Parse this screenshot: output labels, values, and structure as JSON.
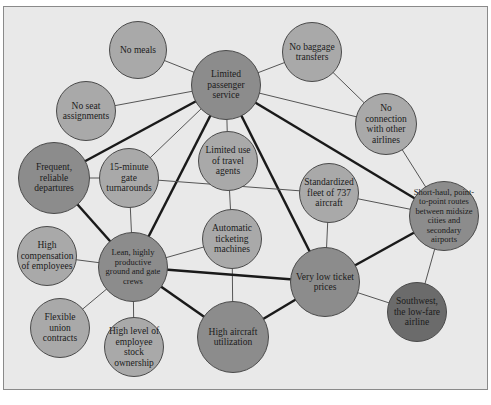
{
  "diagram": {
    "colors": {
      "background": "#e9e9e9",
      "light_node": "#a9a9a9",
      "hub_node": "#8c8c8c",
      "core_node": "#6b6b6b",
      "line": "#1a1a1a"
    },
    "nodes": [
      {
        "id": "lps",
        "label": "Limited passenger service",
        "x": 226,
        "y": 85,
        "r": 35,
        "tone": "mid"
      },
      {
        "id": "nm",
        "label": "No meals",
        "x": 138,
        "y": 50,
        "r": 29,
        "tone": "light"
      },
      {
        "id": "nsa",
        "label": "No seat assignments",
        "x": 86,
        "y": 111,
        "r": 30,
        "tone": "light"
      },
      {
        "id": "nbt",
        "label": "No baggage transfers",
        "x": 312,
        "y": 52,
        "r": 30,
        "tone": "light"
      },
      {
        "id": "nc",
        "label": "No connection with other airlines",
        "x": 386,
        "y": 124,
        "r": 31,
        "tone": "light"
      },
      {
        "id": "frd",
        "label": "Frequent, reliable departures",
        "x": 54,
        "y": 178,
        "r": 36,
        "tone": "mid"
      },
      {
        "id": "gt",
        "label": "15-minute gate turnarounds",
        "x": 129,
        "y": 178,
        "r": 30,
        "tone": "light"
      },
      {
        "id": "lta",
        "label": "Limited use of travel agents",
        "x": 228,
        "y": 161,
        "r": 30,
        "tone": "light"
      },
      {
        "id": "sf",
        "label": "Standardized fleet of 737 aircraft",
        "x": 329,
        "y": 193,
        "r": 30,
        "tone": "light"
      },
      {
        "id": "sh",
        "label": "Short-haul, point-to-point routes between midsize cities and secondary airports",
        "x": 444,
        "y": 216,
        "r": 35,
        "tone": "mid"
      },
      {
        "id": "atm",
        "label": "Automatic ticketing machines",
        "x": 232,
        "y": 239,
        "r": 30,
        "tone": "light"
      },
      {
        "id": "hc",
        "label": "High compensation of employees",
        "x": 47,
        "y": 256,
        "r": 30,
        "tone": "light"
      },
      {
        "id": "lean",
        "label": "Lean, highly productive ground and gate crews",
        "x": 133,
        "y": 267,
        "r": 35,
        "tone": "mid"
      },
      {
        "id": "vlt",
        "label": "Very low ticket prices",
        "x": 325,
        "y": 282,
        "r": 35,
        "tone": "mid"
      },
      {
        "id": "sw",
        "label": "Southwest, the low-fare airline",
        "x": 417,
        "y": 312,
        "r": 30,
        "tone": "dark"
      },
      {
        "id": "fuc",
        "label": "Flexible union contracts",
        "x": 60,
        "y": 328,
        "r": 30,
        "tone": "light"
      },
      {
        "id": "hes",
        "label": "High level of employee stock ownership",
        "x": 134,
        "y": 347,
        "r": 30,
        "tone": "light"
      },
      {
        "id": "hau",
        "label": "High aircraft utilization",
        "x": 233,
        "y": 337,
        "r": 36,
        "tone": "mid"
      }
    ],
    "edges": [
      {
        "from": "lps",
        "to": "nm",
        "w": 1
      },
      {
        "from": "lps",
        "to": "nsa",
        "w": 1
      },
      {
        "from": "lps",
        "to": "nbt",
        "w": 1
      },
      {
        "from": "lps",
        "to": "nc",
        "w": 1
      },
      {
        "from": "lps",
        "to": "frd",
        "w": 2.5
      },
      {
        "from": "lps",
        "to": "gt",
        "w": 1
      },
      {
        "from": "lps",
        "to": "lta",
        "w": 1
      },
      {
        "from": "lps",
        "to": "lean",
        "w": 2.5
      },
      {
        "from": "lps",
        "to": "vlt",
        "w": 2.5
      },
      {
        "from": "lps",
        "to": "sh",
        "w": 2.5
      },
      {
        "from": "nbt",
        "to": "nc",
        "w": 1
      },
      {
        "from": "nc",
        "to": "sh",
        "w": 1
      },
      {
        "from": "frd",
        "to": "gt",
        "w": 1
      },
      {
        "from": "frd",
        "to": "lean",
        "w": 2.5
      },
      {
        "from": "gt",
        "to": "lean",
        "w": 1
      },
      {
        "from": "gt",
        "to": "sf",
        "w": 1
      },
      {
        "from": "lta",
        "to": "atm",
        "w": 1
      },
      {
        "from": "sf",
        "to": "sh",
        "w": 1
      },
      {
        "from": "sf",
        "to": "vlt",
        "w": 1
      },
      {
        "from": "sh",
        "to": "vlt",
        "w": 2.5
      },
      {
        "from": "sh",
        "to": "sw",
        "w": 1
      },
      {
        "from": "atm",
        "to": "lean",
        "w": 1
      },
      {
        "from": "atm",
        "to": "hau",
        "w": 1
      },
      {
        "from": "lean",
        "to": "vlt",
        "w": 2.5
      },
      {
        "from": "lean",
        "to": "hc",
        "w": 1
      },
      {
        "from": "lean",
        "to": "fuc",
        "w": 1
      },
      {
        "from": "lean",
        "to": "hes",
        "w": 1
      },
      {
        "from": "lean",
        "to": "hau",
        "w": 2.5
      },
      {
        "from": "hau",
        "to": "vlt",
        "w": 2.5
      },
      {
        "from": "vlt",
        "to": "sw",
        "w": 1
      }
    ]
  }
}
